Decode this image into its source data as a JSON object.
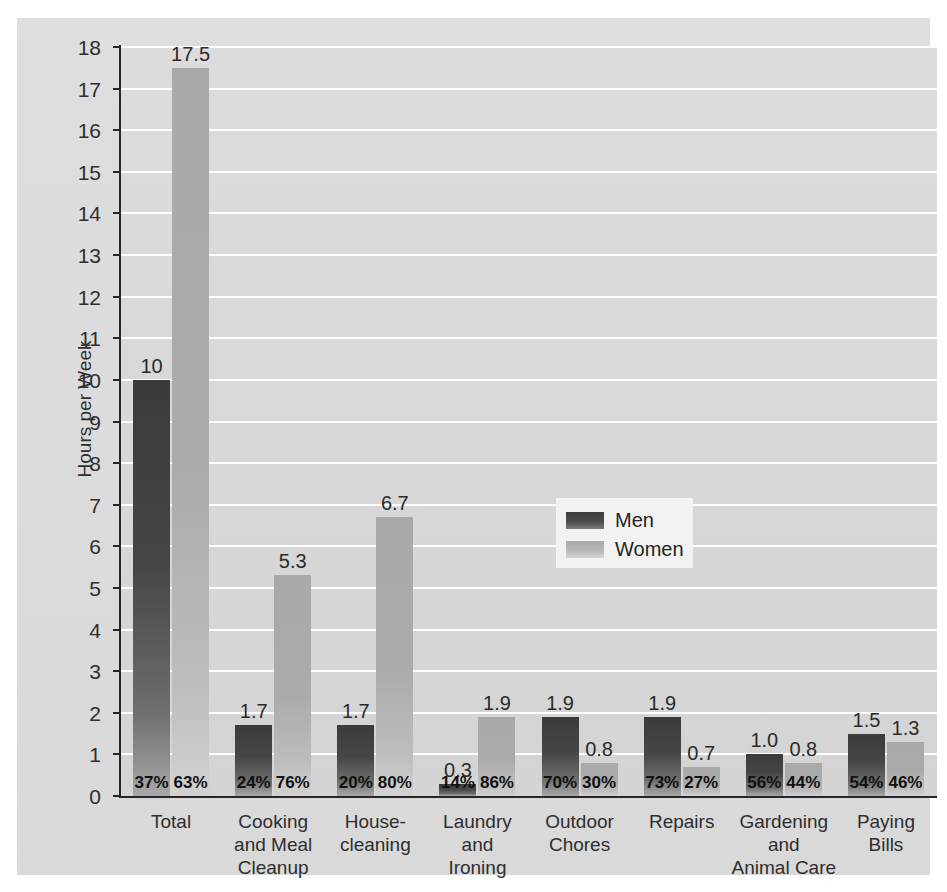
{
  "chart_data": {
    "type": "bar",
    "title": "",
    "xlabel": "",
    "ylabel": "Hours per Week",
    "ylim": [
      0,
      18
    ],
    "ytick_step": 1,
    "grid": true,
    "legend_position": "inside-center-right",
    "categories": [
      "Total",
      "Cooking and Meal Cleanup",
      "House-cleaning",
      "Laundry and Ironing",
      "Outdoor Chores",
      "Repairs",
      "Gardening and Animal Care",
      "Paying Bills"
    ],
    "category_label_lines": [
      [
        "Total"
      ],
      [
        "Cooking",
        "and Meal",
        "Cleanup"
      ],
      [
        "House-",
        "cleaning"
      ],
      [
        "Laundry",
        "and",
        "Ironing"
      ],
      [
        "Outdoor",
        "Chores"
      ],
      [
        "Repairs"
      ],
      [
        "Gardening",
        "and",
        "Animal Care"
      ],
      [
        "Paying",
        "Bills"
      ]
    ],
    "series": [
      {
        "name": "Men",
        "color": "#464646",
        "values": [
          10,
          1.7,
          1.7,
          0.3,
          1.9,
          1.9,
          1.0,
          1.5
        ],
        "value_labels": [
          "10",
          "1.7",
          "1.7",
          "0.3",
          "1.9",
          "1.9",
          "1.0",
          "1.5"
        ],
        "share_labels": [
          "37%",
          "24%",
          "20%",
          "14%",
          "70%",
          "73%",
          "56%",
          "54%"
        ]
      },
      {
        "name": "Women",
        "color": "#ababab",
        "values": [
          17.5,
          5.3,
          6.7,
          1.9,
          0.8,
          0.7,
          0.8,
          1.3
        ],
        "value_labels": [
          "17.5",
          "5.3",
          "6.7",
          "1.9",
          "0.8",
          "0.7",
          "0.8",
          "1.3"
        ],
        "share_labels": [
          "63%",
          "76%",
          "80%",
          "86%",
          "30%",
          "27%",
          "44%",
          "46%"
        ]
      }
    ],
    "ytick_labels": [
      "0",
      "1",
      "2",
      "3",
      "4",
      "5",
      "6",
      "7",
      "8",
      "9",
      "10",
      "11",
      "12",
      "13",
      "14",
      "15",
      "16",
      "17",
      "18"
    ],
    "legend": [
      {
        "label": "Men",
        "swatch": "men"
      },
      {
        "label": "Women",
        "swatch": "women"
      }
    ]
  },
  "colors": {
    "men_bar": "#464646",
    "women_bar": "#ababab",
    "plot_background": "#d8d8d8",
    "card_background": "#dcdcdc",
    "gridline": "#ffffff",
    "axis": "#262626",
    "text": "#2e2e2e"
  }
}
